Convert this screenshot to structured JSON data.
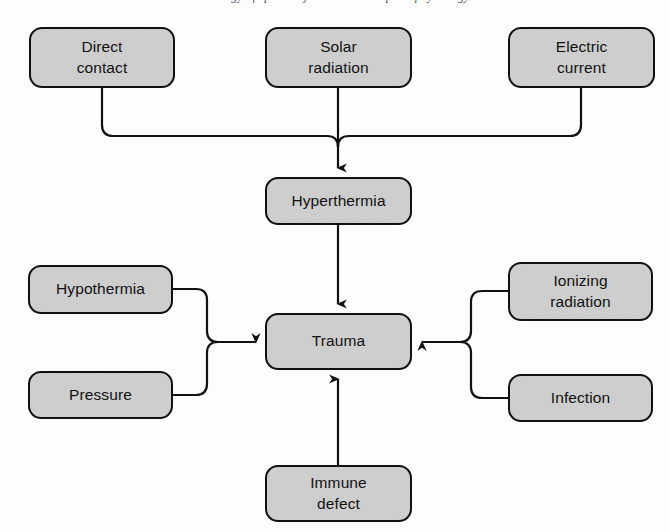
{
  "page": {
    "header_remnant": "Etiology of sports injuries and their pathophysiology",
    "folio": "15",
    "diagram_title": "Causes of trauma",
    "colors": {
      "node_fill": "#c9c9c9",
      "node_border": "#111111",
      "connector": "#111111",
      "page_background": "#fdfdfd"
    }
  },
  "diagram": {
    "type": "flowchart",
    "nodes": [
      {
        "id": "direct-contact",
        "label": "Direct contact",
        "x": 29,
        "y": 27,
        "w": 146,
        "h": 61,
        "lines": [
          "Direct",
          "contact"
        ]
      },
      {
        "id": "solar-radiation",
        "label": "Solar radiation",
        "x": 265,
        "y": 27,
        "w": 147,
        "h": 61,
        "lines": [
          "Solar",
          "radiation"
        ]
      },
      {
        "id": "electric-current",
        "label": "Electric current",
        "x": 508,
        "y": 27,
        "w": 147,
        "h": 61,
        "lines": [
          "Electric",
          "current"
        ]
      },
      {
        "id": "hyperthermia",
        "label": "Hyperthermia",
        "x": 265,
        "y": 177,
        "w": 147,
        "h": 48,
        "lines": [
          "Hyperthermia"
        ]
      },
      {
        "id": "hypothermia",
        "label": "Hypothermia",
        "x": 28,
        "y": 265,
        "w": 145,
        "h": 49,
        "lines": [
          "Hypothermia"
        ]
      },
      {
        "id": "pressure",
        "label": "Pressure",
        "x": 28,
        "y": 371,
        "w": 145,
        "h": 48,
        "lines": [
          "Pressure"
        ]
      },
      {
        "id": "trauma",
        "label": "Trauma",
        "x": 265,
        "y": 313,
        "w": 147,
        "h": 57,
        "lines": [
          "Trauma"
        ]
      },
      {
        "id": "ionizing-radiation",
        "label": "Ionizing radiation",
        "x": 508,
        "y": 262,
        "w": 145,
        "h": 59,
        "lines": [
          "Ionizing",
          "radiation"
        ]
      },
      {
        "id": "infection",
        "label": "Infection",
        "x": 508,
        "y": 374,
        "w": 145,
        "h": 48,
        "lines": [
          "Infection"
        ]
      },
      {
        "id": "immune-defect",
        "label": "Immune defect",
        "x": 265,
        "y": 465,
        "w": 147,
        "h": 57,
        "lines": [
          "Immune",
          "defect"
        ]
      }
    ],
    "edges": [
      {
        "from": "direct-contact",
        "to": "hyperthermia",
        "style": "elbow-merge-down"
      },
      {
        "from": "solar-radiation",
        "to": "hyperthermia",
        "style": "straight-down"
      },
      {
        "from": "electric-current",
        "to": "hyperthermia",
        "style": "elbow-merge-down"
      },
      {
        "from": "hyperthermia",
        "to": "trauma",
        "style": "straight-down"
      },
      {
        "from": "hypothermia",
        "to": "trauma",
        "style": "elbow-merge-right"
      },
      {
        "from": "pressure",
        "to": "trauma",
        "style": "elbow-merge-right"
      },
      {
        "from": "ionizing-radiation",
        "to": "trauma",
        "style": "elbow-merge-left"
      },
      {
        "from": "infection",
        "to": "trauma",
        "style": "elbow-merge-left"
      },
      {
        "from": "immune-defect",
        "to": "trauma",
        "style": "straight-up"
      }
    ]
  }
}
